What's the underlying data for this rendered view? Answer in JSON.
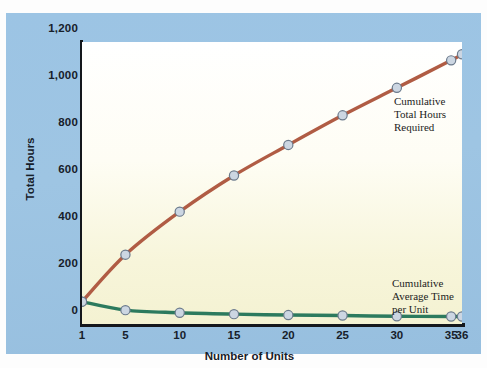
{
  "chart_data": {
    "type": "line",
    "title": "",
    "xlabel": "Number of Units",
    "ylabel": "Total Hours",
    "x": [
      1,
      5,
      10,
      15,
      20,
      25,
      30,
      35,
      36
    ],
    "xticks": [
      "1",
      "5",
      "10",
      "15",
      "20",
      "25",
      "30",
      "35",
      "36"
    ],
    "yticks": [
      "0",
      "200",
      "400",
      "600",
      "800",
      "1,000",
      "1,200"
    ],
    "ytickvalues": [
      0,
      200,
      400,
      600,
      800,
      1000,
      1200
    ],
    "xlim": [
      1,
      36
    ],
    "ylim": [
      0,
      1200
    ],
    "grid": false,
    "legend_position": "inline-annotation",
    "series": [
      {
        "name": "Cumulative Total Hours Required",
        "color": "#b05c44",
        "values": [
          95,
          295,
          478,
          632,
          762,
          888,
          1005,
          1122,
          1148
        ]
      },
      {
        "name": "Cumulative Average Time per Unit",
        "color": "#2c7a5e",
        "values": [
          95,
          59,
          48,
          42,
          38,
          36,
          33,
          32,
          32
        ]
      }
    ],
    "marker": {
      "fill": "#ccd6e2",
      "stroke": "#6b7a8c",
      "radius": 4.6
    },
    "annotations": [
      {
        "id": "total-hours",
        "lines": [
          "Cumulative",
          "Total Hours",
          "Required"
        ]
      },
      {
        "id": "average-time",
        "lines": [
          "Cumulative",
          "Average Time",
          "per Unit"
        ]
      }
    ]
  },
  "colors": {
    "panel": "#9cc4e4",
    "plot_top": "#ffffff",
    "plot_bottom": "#f4f2d2",
    "axis": "#14171c",
    "series_total": "#b05c44",
    "series_average": "#2c7a5e"
  }
}
